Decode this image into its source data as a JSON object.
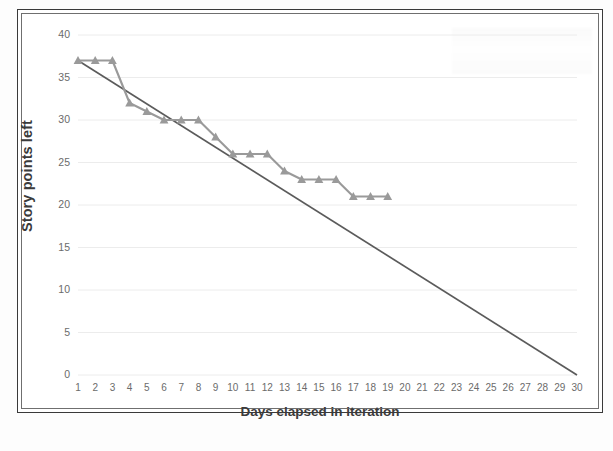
{
  "chart_data": {
    "type": "line",
    "title": "",
    "xlabel": "Days elapsed in iteration",
    "ylabel": "Story points left",
    "xlim": [
      1,
      30
    ],
    "ylim": [
      0,
      40
    ],
    "ytick_step": 5,
    "grid": "horizontal",
    "legend": "none",
    "x_tick_labels": [
      "1",
      "2",
      "3",
      "4",
      "5",
      "6",
      "7",
      "8",
      "9",
      "10",
      "11",
      "12",
      "13",
      "14",
      "15",
      "16",
      "17",
      "18",
      "19",
      "20",
      "21",
      "22",
      "23",
      "24",
      "25",
      "26",
      "27",
      "28",
      "29",
      "30"
    ],
    "y_tick_labels": [
      "0",
      "5",
      "10",
      "15",
      "20",
      "25",
      "30",
      "35",
      "40"
    ],
    "series": [
      {
        "name": "actual-burndown",
        "marker": "triangle",
        "color": "#9a9a9a",
        "x": [
          1,
          2,
          3,
          4,
          5,
          6,
          7,
          8,
          9,
          10,
          11,
          12,
          13,
          14,
          15,
          16,
          17,
          18,
          19
        ],
        "values": [
          37,
          37,
          37,
          32,
          31,
          30,
          30,
          30,
          28,
          26,
          26,
          26,
          24,
          23,
          23,
          23,
          21,
          21,
          21
        ]
      },
      {
        "name": "ideal-burndown-guideline",
        "marker": "none",
        "color": "#5b5b5b",
        "x": [
          1,
          30
        ],
        "values": [
          37,
          0
        ]
      }
    ]
  },
  "axis": {
    "y_title": "Story points left",
    "x_title": "Days elapsed in iteration"
  },
  "colors": {
    "actual_line": "#9a9a9a",
    "ideal_line": "#5b5b5b",
    "gridline": "#ececec",
    "tick_text": "#6b6b6b",
    "axis_title": "#3b3b3b",
    "frame_outer": "#3a3a3a",
    "frame_inner": "#6f6f6f"
  }
}
